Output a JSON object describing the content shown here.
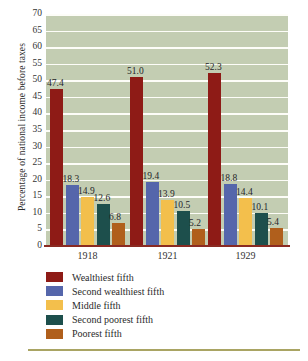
{
  "chart_data": {
    "type": "bar",
    "title": "",
    "xlabel": "",
    "ylabel": "Percentage of national income before taxes",
    "categories": [
      "1918",
      "1921",
      "1929"
    ],
    "ylim": [
      0,
      70
    ],
    "ytick_step": 5,
    "yticks": [
      "70",
      "65",
      "60",
      "55",
      "50",
      "45",
      "40",
      "35",
      "30",
      "25",
      "20",
      "15",
      "10",
      "5",
      "0"
    ],
    "grid": true,
    "legend_position": "bottom-left",
    "series": [
      {
        "name": "Wealthiest fifth",
        "color": "#8e1b16",
        "values": [
          47.4,
          51.0,
          52.3
        ],
        "labels": [
          "47.4",
          "51.0",
          "52.3"
        ]
      },
      {
        "name": "Second wealthiest fifth",
        "color": "#5566ab",
        "values": [
          18.3,
          19.4,
          18.8
        ],
        "labels": [
          "18.3",
          "19.4",
          "18.8"
        ]
      },
      {
        "name": "Middle fifth",
        "color": "#f3bf4c",
        "values": [
          14.9,
          13.9,
          14.4
        ],
        "labels": [
          "14.9",
          "13.9",
          "14.4"
        ]
      },
      {
        "name": "Second poorest fifth",
        "color": "#1d4f4c",
        "values": [
          12.6,
          10.5,
          10.1
        ],
        "labels": [
          "12.6",
          "10.5",
          "10.1"
        ]
      },
      {
        "name": "Poorest fifth",
        "color": "#b05f1c",
        "values": [
          6.8,
          5.2,
          5.4
        ],
        "labels": [
          "6.8",
          "5.2",
          "5.4"
        ]
      }
    ],
    "plot_background": "#c3cdb2",
    "gridline_color": "#fdfdf8",
    "axis_color": "#8a2a22",
    "footer_rule_color": "#a9a463"
  }
}
